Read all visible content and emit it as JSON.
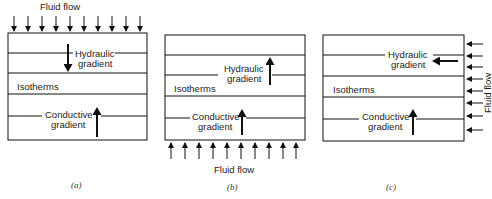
{
  "figure": {
    "panels": [
      {
        "id": "a",
        "caption": "(a)",
        "fluid_flow_label": "Fluid flow",
        "fluid_flow_direction": "downward (from top)",
        "hydraulic_label_line1": "Hydraulic",
        "hydraulic_label_line2": "gradient",
        "hydraulic_direction": "down",
        "isotherms_label": "Isotherms",
        "conductive_label_line1": "Conductive",
        "conductive_label_line2": "gradient",
        "conductive_direction": "up"
      },
      {
        "id": "b",
        "caption": "(b)",
        "fluid_flow_label": "Fluid flow",
        "fluid_flow_direction": "upward (from bottom)",
        "hydraulic_label_line1": "Hydraulic",
        "hydraulic_label_line2": "gradient",
        "hydraulic_direction": "up",
        "isotherms_label": "Isotherms",
        "conductive_label_line1": "Conductive",
        "conductive_label_line2": "gradient",
        "conductive_direction": "up"
      },
      {
        "id": "c",
        "caption": "(c)",
        "fluid_flow_label": "Fluid flow",
        "fluid_flow_direction": "leftward (from right side)",
        "hydraulic_label_line1": "Hydraulic",
        "hydraulic_label_line2": "gradient",
        "hydraulic_direction": "left",
        "isotherms_label": "Isotherms",
        "conductive_label_line1": "Conductive",
        "conductive_label_line2": "gradient",
        "conductive_direction": "up"
      }
    ],
    "colors": {
      "ink": "#111111",
      "background": "#ffffff"
    }
  }
}
